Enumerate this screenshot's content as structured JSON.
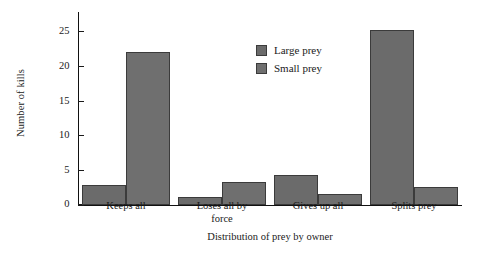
{
  "chart_data": {
    "type": "bar",
    "title": "",
    "xlabel": "Distribution of prey by owner",
    "ylabel": "Number of kills",
    "categories": [
      "Keeps all",
      "Loses all by force",
      "Gives up all",
      "Splits prey"
    ],
    "series": [
      {
        "name": "Large prey",
        "color": "#6b6b6b",
        "values": [
          3.0,
          1.2,
          4.4,
          25.3
        ]
      },
      {
        "name": "Small prey",
        "color": "#6f6f6f",
        "values": [
          22.1,
          3.4,
          1.6,
          2.6
        ]
      }
    ],
    "ylim": [
      0,
      27
    ],
    "yticks": [
      0,
      5,
      10,
      15,
      20,
      25
    ],
    "grid": false,
    "legend_position": "top-center",
    "axis_color": "#111111",
    "background": "#ffffff"
  },
  "axes": {
    "y_tick_labels": [
      "0",
      "5",
      "10",
      "15",
      "20",
      "25"
    ],
    "y_title": "Number of kills",
    "x_title": "Distribution of prey by owner",
    "x_tick_labels": [
      {
        "lines": [
          "Keeps all"
        ]
      },
      {
        "lines": [
          "Loses all by",
          "force"
        ]
      },
      {
        "lines": [
          "Gives up all"
        ]
      },
      {
        "lines": [
          "Splits prey"
        ]
      }
    ]
  },
  "legend": {
    "items": [
      {
        "label": "Large prey",
        "color": "#6b6b6b"
      },
      {
        "label": "Small prey",
        "color": "#6f6f6f"
      }
    ]
  }
}
